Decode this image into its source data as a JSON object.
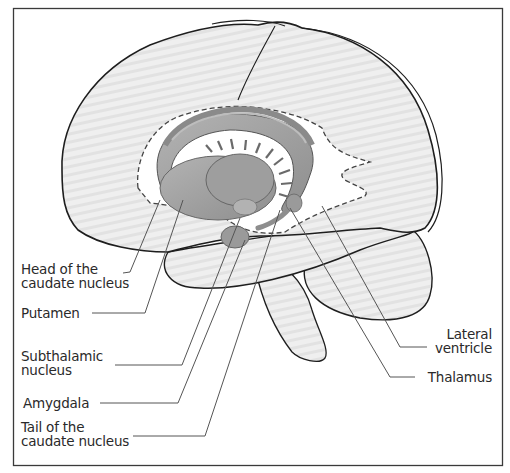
{
  "figure": {
    "type": "anatomical-diagram",
    "colors": {
      "frame": "#3a3a3a",
      "brain_fill": "#ececec",
      "brain_outline": "#1e1e1e",
      "nuclei_fill": "#a9a9a9",
      "nuclei_dark": "#8c8c8c",
      "ventricle_fill": "#ffffff",
      "leader_line": "#555555",
      "text": "#2a2a2a"
    }
  },
  "labels": {
    "left": [
      {
        "id": "head-caudate",
        "line1": "Head of the",
        "line2": "caudate nucleus"
      },
      {
        "id": "putamen",
        "line1": "Putamen"
      },
      {
        "id": "subthalamic",
        "line1": "Subthalamic",
        "line2": "nucleus"
      },
      {
        "id": "amygdala",
        "line1": "Amygdala"
      },
      {
        "id": "tail-caudate",
        "line1": "Tail of the",
        "line2": "caudate nucleus"
      }
    ],
    "right": [
      {
        "id": "lateral-ventricle",
        "line1": "Lateral",
        "line2": "ventricle"
      },
      {
        "id": "thalamus",
        "line1": "Thalamus"
      }
    ]
  }
}
